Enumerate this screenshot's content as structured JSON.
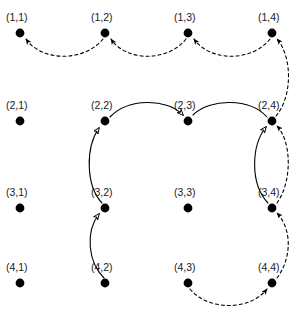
{
  "figure": {
    "width": 305,
    "height": 332,
    "background": "#ffffff"
  },
  "style": {
    "node_color": "#000000",
    "node_radius": 4.4,
    "label_color": "#1a1a1a",
    "solid_edge_color": "#000000",
    "dashed_edge_color": "#000000",
    "edge_width": 1.1,
    "dash_pattern": "3,3"
  },
  "nodes": [
    {
      "id": "n11",
      "label": "(1,1)",
      "row": 1,
      "col": 1,
      "cx": 20,
      "cy": 33,
      "label_x": 6,
      "label_y": 12
    },
    {
      "id": "n12",
      "label": "(1,2)",
      "row": 1,
      "col": 2,
      "cx": 105,
      "cy": 33,
      "label_x": 91,
      "label_y": 12
    },
    {
      "id": "n13",
      "label": "(1,3)",
      "row": 1,
      "col": 3,
      "cx": 188,
      "cy": 33,
      "label_x": 174,
      "label_y": 12
    },
    {
      "id": "n14",
      "label": "(1,4)",
      "row": 1,
      "col": 4,
      "cx": 272,
      "cy": 33,
      "label_x": 258,
      "label_y": 12
    },
    {
      "id": "n21",
      "label": "(2,1)",
      "row": 2,
      "col": 1,
      "cx": 20,
      "cy": 121,
      "label_x": 6,
      "label_y": 100
    },
    {
      "id": "n22",
      "label": "(2,2)",
      "row": 2,
      "col": 2,
      "cx": 105,
      "cy": 121,
      "label_x": 91,
      "label_y": 100
    },
    {
      "id": "n23",
      "label": "(2,3)",
      "row": 2,
      "col": 3,
      "cx": 188,
      "cy": 121,
      "label_x": 174,
      "label_y": 100
    },
    {
      "id": "n24",
      "label": "(2,4)",
      "row": 2,
      "col": 4,
      "cx": 272,
      "cy": 121,
      "label_x": 258,
      "label_y": 100
    },
    {
      "id": "n31",
      "label": "(3,1)",
      "row": 3,
      "col": 1,
      "cx": 20,
      "cy": 208,
      "label_x": 6,
      "label_y": 187
    },
    {
      "id": "n32",
      "label": "(3,2)",
      "row": 3,
      "col": 2,
      "cx": 105,
      "cy": 208,
      "label_x": 91,
      "label_y": 187
    },
    {
      "id": "n33",
      "label": "(3,3)",
      "row": 3,
      "col": 3,
      "cx": 188,
      "cy": 208,
      "label_x": 174,
      "label_y": 187
    },
    {
      "id": "n34",
      "label": "(3,4)",
      "row": 3,
      "col": 4,
      "cx": 272,
      "cy": 208,
      "label_x": 258,
      "label_y": 187
    },
    {
      "id": "n41",
      "label": "(4,1)",
      "row": 4,
      "col": 1,
      "cx": 20,
      "cy": 283,
      "label_x": 6,
      "label_y": 262
    },
    {
      "id": "n42",
      "label": "(4,2)",
      "row": 4,
      "col": 2,
      "cx": 105,
      "cy": 283,
      "label_x": 91,
      "label_y": 262
    },
    {
      "id": "n43",
      "label": "(4,3)",
      "row": 4,
      "col": 3,
      "cx": 188,
      "cy": 283,
      "label_x": 174,
      "label_y": 262
    },
    {
      "id": "n44",
      "label": "(4,4)",
      "row": 4,
      "col": 4,
      "cx": 272,
      "cy": 283,
      "label_x": 258,
      "label_y": 262
    }
  ],
  "edges": [
    {
      "id": "e-12-11",
      "from": "(1,2)",
      "to": "(1,1)",
      "style": "dashed",
      "arrowhead": "filled",
      "path": "M 103 39 C 84 62, 42 62, 26 39"
    },
    {
      "id": "e-13-12",
      "from": "(1,3)",
      "to": "(1,2)",
      "style": "dashed",
      "arrowhead": "filled",
      "path": "M 186 39 C 168 62, 126 62, 111 39"
    },
    {
      "id": "e-14-13",
      "from": "(1,4)",
      "to": "(1,3)",
      "style": "dashed",
      "arrowhead": "filled",
      "path": "M 270 39 C 252 62, 210 62, 194 39"
    },
    {
      "id": "e-24-14",
      "from": "(2,4)",
      "to": "(1,4)",
      "style": "dashed",
      "arrowhead": "filled",
      "path": "M 276 116 C 293 96, 292 56, 277 39"
    },
    {
      "id": "e-34-24",
      "from": "(3,4)",
      "to": "(2,4)",
      "style": "dashed",
      "arrowhead": "filled",
      "path": "M 277 203 C 292 182, 292 142, 277 126"
    },
    {
      "id": "e-44-34",
      "from": "(4,4)",
      "to": "(3,4)",
      "style": "dashed",
      "arrowhead": "filled",
      "path": "M 277 278 C 292 258, 292 229, 277 213"
    },
    {
      "id": "e-43-44",
      "from": "(4,3)",
      "to": "(4,4)",
      "style": "dashed",
      "arrowhead": "filled",
      "path": "M 190 289 C 208 311, 250 311, 267 289"
    },
    {
      "id": "e-42-32",
      "from": "(4,2)",
      "to": "(3,2)",
      "style": "solid",
      "arrowhead": "hollow",
      "path": "M 104 278 C 88 262, 85 232, 99 214"
    },
    {
      "id": "e-32-22",
      "from": "(3,2)",
      "to": "(2,2)",
      "style": "solid",
      "arrowhead": "hollow",
      "path": "M 102 203 C 86 186, 85 148, 99 128"
    },
    {
      "id": "e-22-23",
      "from": "(2,2)",
      "to": "(2,3)",
      "style": "solid",
      "arrowhead": "hollow",
      "path": "M 110 117 C 128 98, 167 98, 183 115"
    },
    {
      "id": "e-24-23",
      "from": "(2,4)",
      "to": "(2,3)",
      "style": "solid",
      "arrowhead": "none",
      "path": "M 267 117 C 250 98, 210 98, 193 115"
    },
    {
      "id": "e-34-24s",
      "from": "(3,4)",
      "to": "(2,4)",
      "style": "solid",
      "arrowhead": "hollow",
      "path": "M 268 203 C 250 184, 251 146, 266 127"
    }
  ],
  "legend": {
    "dashed_meaning": "dashed directed arc with filled arrowhead",
    "solid_meaning": "solid directed arc with hollow arrowhead"
  }
}
